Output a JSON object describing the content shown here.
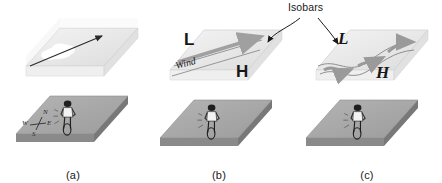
{
  "figure": {
    "kind": "three-panel meteorology diagram",
    "background_color": "#ffffff",
    "annotation": {
      "isobars_label": "Isobars",
      "leader_targets": [
        "panel-b",
        "panel-c"
      ]
    }
  },
  "panels": [
    {
      "id": "a",
      "caption": "(a)",
      "upper_plane": {
        "content": "cloud puff with straight airflow arrow",
        "arrow_direction": "up-right",
        "cloud_color": "#ffffff"
      },
      "ground_plane": {
        "figure": "cyclist seen from behind",
        "compass": {
          "north": "N",
          "south": "S",
          "east": "E",
          "west": "W"
        }
      },
      "pressure_labels": [],
      "wind_label": null
    },
    {
      "id": "b",
      "caption": "(b)",
      "upper_plane": {
        "content": "straight parallel isobars with wind arrow",
        "isobar_shape": "straight",
        "arrow_direction": "right"
      },
      "ground_plane": {
        "figure": "cyclist seen from behind",
        "compass": null
      },
      "pressure_labels": [
        {
          "text": "L",
          "meaning": "low pressure",
          "style": "upright-bold"
        },
        {
          "text": "H",
          "meaning": "high pressure",
          "style": "upright-bold"
        }
      ],
      "wind_label": "Wind"
    },
    {
      "id": "c",
      "caption": "(c)",
      "upper_plane": {
        "content": "curved wavy isobars with flow arrows",
        "isobar_shape": "curved",
        "arrow_direction": "right"
      },
      "ground_plane": {
        "figure": "cyclist seen from behind",
        "compass": null
      },
      "pressure_labels": [
        {
          "text": "L",
          "meaning": "low pressure",
          "style": "italic-serif"
        },
        {
          "text": "H",
          "meaning": "high pressure",
          "style": "italic-serif"
        }
      ],
      "wind_label": null
    }
  ],
  "colors": {
    "slab_top": "#e9e9e9",
    "slab_front": "#c9c9c9",
    "ground_top": "#a8a8a8",
    "ground_edge": "#7d7d7d",
    "arrow_gray": "#9a9a9a",
    "ink": "#1a1a1a"
  }
}
